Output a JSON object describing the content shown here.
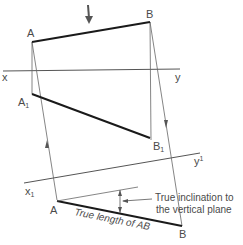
{
  "diagram": {
    "colors": {
      "object_line": "#1a1a1a",
      "thin_line": "#555555",
      "text": "#4a4a4a",
      "background": "#ffffff"
    },
    "labels": {
      "A_top": "A",
      "B_top": "B",
      "x": "x",
      "y": "y",
      "A1": "A",
      "A1_sub": "1",
      "B1": "B",
      "B1_sub": "1",
      "x1": "x",
      "x1_sub": "1",
      "y1": "y",
      "y1_sub": "1",
      "A_aux": "A",
      "B_aux": "B",
      "true_length": "True length of AB",
      "inclination_line1": "True inclination to",
      "inclination_line2": "the vertical plane"
    },
    "annotations": {
      "view_direction_arrow": "downward arrow above top view indicating viewing direction"
    }
  }
}
